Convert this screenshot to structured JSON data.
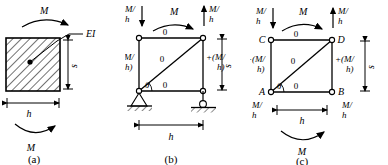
{
  "figure": {
    "type": "structural-engineering-diagram",
    "ink_color": "#000000",
    "background": "#ffffff"
  },
  "panels": [
    {
      "id": "a",
      "caption": "(a)",
      "kind": "hatched-solid-panel",
      "labels": {
        "moment_top": "M",
        "moment_bottom": "M",
        "stiffness": "EI",
        "dim_vertical": "s",
        "dim_horizontal": "h"
      },
      "notes": {
        "hatch": "45-degree diagonal hatching",
        "center_marker": "dot",
        "leader": "EI leader line to center dot",
        "arc_top": "clockwise moment arc above panel",
        "arc_bottom": "moment arc below panel"
      }
    },
    {
      "id": "b",
      "caption": "(b)",
      "kind": "truss-frame-with-supports",
      "labels": {
        "moment_top": "M",
        "force_top_left": "M/h",
        "force_top_right": "M/h",
        "chord_top_force": "0",
        "chord_bottom_force": "0",
        "diagonal_force": "0",
        "post_left_force": "−(M/h)",
        "post_right_force": "+(M/h)",
        "angle": "θ",
        "dim_vertical": "s",
        "dim_horizontal": "h"
      },
      "forces": {
        "top_left_arrow": "down",
        "top_right_arrow": "up"
      },
      "supports": {
        "left": "pin",
        "right": "roller"
      }
    },
    {
      "id": "c",
      "caption": "(c)",
      "kind": "free-body-equilibrium",
      "labels": {
        "moment_top": "M",
        "moment_bottom": "M",
        "force_top_left": "M/h",
        "force_top_right": "M/h",
        "force_bottom_left": "M/h",
        "force_bottom_right": "M/h",
        "chord_top_force": "0",
        "chord_bottom_force": "0",
        "diagonal_force": "0",
        "post_left_force": "−(M/h)",
        "post_right_force": "+(M/h)",
        "angle": "θ",
        "dim_vertical": "s",
        "dim_horizontal": "h"
      },
      "nodes": {
        "bottom_left": "A",
        "bottom_right": "B",
        "top_left": "C",
        "top_right": "D"
      },
      "forces": {
        "top_left_arrow": "down",
        "top_right_arrow": "up"
      }
    }
  ]
}
